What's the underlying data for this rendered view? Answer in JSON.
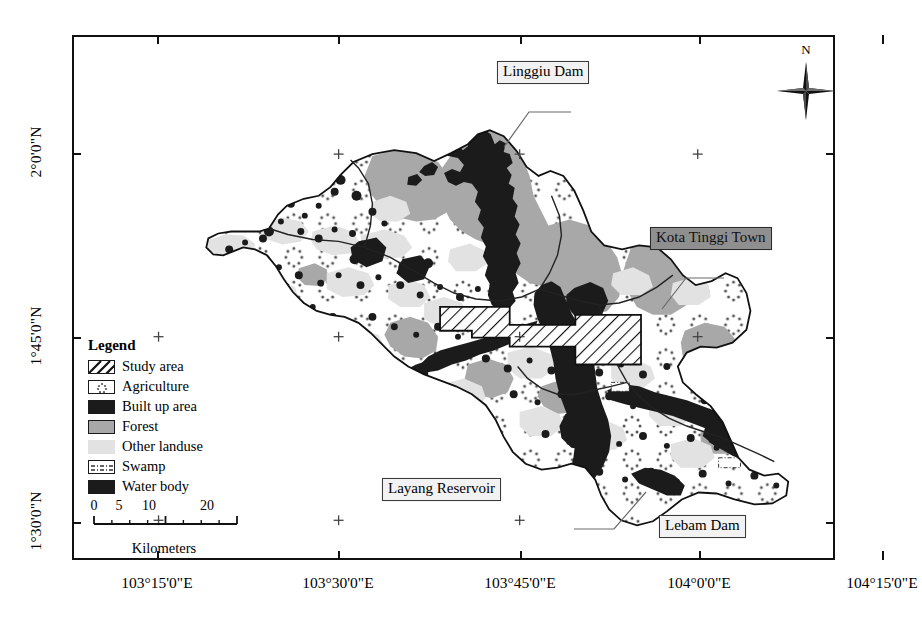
{
  "map": {
    "title": "Kota Tinggi / Johor River Basin land use map",
    "latitude_labels": [
      {
        "text": "2°0'0\"N",
        "y": 118
      },
      {
        "text": "1°45'0\"N",
        "y": 302
      },
      {
        "text": "1°30'0\"N",
        "y": 487
      }
    ],
    "longitude_labels": [
      {
        "text": "103°15'0\"E",
        "x": 85
      },
      {
        "text": "103°30'0\"E",
        "x": 266
      },
      {
        "text": "103°45'0\"E",
        "x": 448
      },
      {
        "text": "104°0'0\"E",
        "x": 627
      },
      {
        "text": "104°15'0\"E",
        "x": 810
      }
    ],
    "graticule_crosses": [
      {
        "x": 266,
        "y": 118
      },
      {
        "x": 448,
        "y": 118
      },
      {
        "x": 627,
        "y": 118
      },
      {
        "x": 810,
        "y": 118
      },
      {
        "x": 85,
        "y": 302
      },
      {
        "x": 266,
        "y": 302
      },
      {
        "x": 448,
        "y": 302
      },
      {
        "x": 627,
        "y": 302
      },
      {
        "x": 810,
        "y": 302
      },
      {
        "x": 85,
        "y": 487
      },
      {
        "x": 266,
        "y": 487
      },
      {
        "x": 448,
        "y": 487
      },
      {
        "x": 627,
        "y": 487
      },
      {
        "x": 810,
        "y": 487
      }
    ]
  },
  "callouts": [
    {
      "name": "linggiu-dam",
      "label": "Linggiu Dam",
      "style": "plain",
      "x": 497,
      "y": 61,
      "leader": "M497,75 L455,75 L430,110"
    },
    {
      "name": "kota-tinggi-town",
      "label": "Kota Tinggi Town",
      "style": "shaded",
      "x": 650,
      "y": 227,
      "leader": "M650,241 L612,241 L588,272"
    },
    {
      "name": "layang-reservoir",
      "label": "Layang Reservoir",
      "style": "plain",
      "x": 382,
      "y": 478,
      "leader": "M500,492 L540,492 L572,455"
    },
    {
      "name": "lebam-dam",
      "label": "Lebam Dam",
      "style": "plain",
      "x": 659,
      "y": 515,
      "leader": "M748,529 L775,529 L795,500"
    }
  ],
  "legend": {
    "title": "Legend",
    "items": [
      {
        "key": "study-area",
        "label": "Study area",
        "fill": "#ffffff",
        "pattern": "diagonal-hatch"
      },
      {
        "key": "agriculture",
        "label": "Agriculture",
        "fill": "#ffffff",
        "pattern": "dot-cluster"
      },
      {
        "key": "built-up",
        "label": "Built up area",
        "fill": "#1b1b1b",
        "pattern": "solid"
      },
      {
        "key": "forest",
        "label": "Forest",
        "fill": "#a8a8a8",
        "pattern": "solid"
      },
      {
        "key": "other-landuse",
        "label": "Other landuse",
        "fill": "#e2e2e2",
        "pattern": "solid"
      },
      {
        "key": "swamp",
        "label": "Swamp",
        "fill": "#ffffff",
        "pattern": "dash-dot"
      },
      {
        "key": "water-body",
        "label": "Water body",
        "fill": "#1b1b1b",
        "pattern": "solid"
      }
    ]
  },
  "scalebar": {
    "ticks": [
      {
        "value": "0",
        "pos": 0
      },
      {
        "value": "5",
        "pos": 25
      },
      {
        "value": "10",
        "pos": 55
      },
      {
        "value": "20",
        "pos": 113
      }
    ],
    "units_label": "Kilometers"
  },
  "compass": {
    "north_letter": "N"
  },
  "colors": {
    "forest": "#a8a8a8",
    "other_landuse": "#e2e2e2",
    "built_up": "#1b1b1b",
    "water_body": "#1b1b1b",
    "background": "#ffffff",
    "frame": "#111111",
    "callout_plain_bg": "#f2f2f2",
    "callout_shaded_bg": "#8f8f8f"
  }
}
